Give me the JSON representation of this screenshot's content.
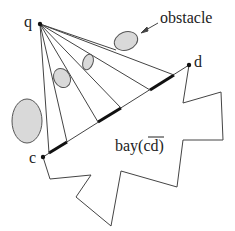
{
  "diagram": {
    "labels": {
      "q": "q",
      "c": "c",
      "d": "d",
      "obstacle": "obstacle",
      "bay": "bay(cd)"
    },
    "colors": {
      "stroke": "#333333",
      "obstacle_fill": "#d9d9d9",
      "bold_segment": "#111111"
    },
    "points": {
      "q": [
        40,
        24
      ],
      "c": [
        43,
        157
      ],
      "d": [
        189,
        65
      ]
    }
  }
}
